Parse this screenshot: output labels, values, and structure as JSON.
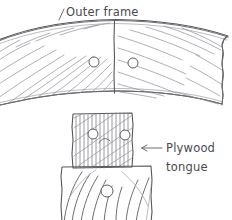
{
  "drawing": {
    "title": "Outer frame and plywood tongue joint detail",
    "medium": "pencil sketch",
    "ink_color": "#6e6e72",
    "paper_color": "#ffffff"
  },
  "labels": {
    "outer_frame": "Outer frame",
    "plywood_tongue_line1": "Plywood",
    "plywood_tongue_line2": "tongue"
  },
  "parts": {
    "outer_frame": {
      "name": "Outer frame",
      "hatching": "diagonal wood grain",
      "holes": 2
    },
    "plywood_tongue": {
      "name": "Plywood tongue",
      "hatching": "dense cross diagonal",
      "holes": 2
    },
    "lower_block": {
      "name": "Lower block",
      "hatching": "end grain arcs",
      "holes": 1
    }
  }
}
